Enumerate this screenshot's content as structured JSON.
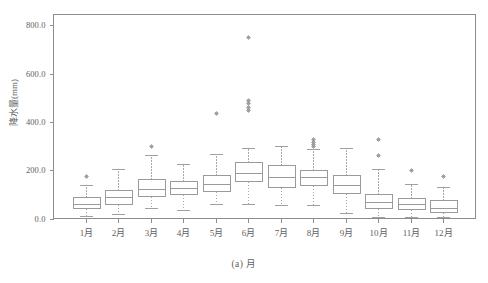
{
  "chart_data": {
    "type": "box",
    "title": "",
    "caption": "(a) 月",
    "xlabel": "",
    "ylabel": "降水量(mm)",
    "grid": false,
    "legend": "none",
    "xlim": [
      0,
      13
    ],
    "ylim": [
      -20,
      850
    ],
    "yticks": [
      0.0,
      200.0,
      400.0,
      600.0,
      800.0
    ],
    "ytick_labels": [
      "0.0",
      "200.0",
      "400.0",
      "600.0",
      "800.0"
    ],
    "categories": [
      "1月",
      "2月",
      "3月",
      "4月",
      "5月",
      "6月",
      "7月",
      "8月",
      "9月",
      "10月",
      "11月",
      "12月"
    ],
    "boxes": [
      {
        "category": "1月",
        "whisker_low": 10,
        "q1": 45,
        "median": 62,
        "q3": 88,
        "whisker_high": 140,
        "outliers": [
          178
        ]
      },
      {
        "category": "2月",
        "whisker_low": 20,
        "q1": 62,
        "median": 88,
        "q3": 118,
        "whisker_high": 205,
        "outliers": []
      },
      {
        "category": "3月",
        "whisker_low": 45,
        "q1": 95,
        "median": 122,
        "q3": 165,
        "whisker_high": 262,
        "outliers": [
          300
        ]
      },
      {
        "category": "4月",
        "whisker_low": 36,
        "q1": 100,
        "median": 125,
        "q3": 155,
        "whisker_high": 225,
        "outliers": []
      },
      {
        "category": "5月",
        "whisker_low": 60,
        "q1": 115,
        "median": 142,
        "q3": 182,
        "whisker_high": 268,
        "outliers": [
          435
        ]
      },
      {
        "category": "6月",
        "whisker_low": 62,
        "q1": 155,
        "median": 188,
        "q3": 235,
        "whisker_high": 290,
        "outliers": [
          450,
          462,
          478,
          490,
          750
        ]
      },
      {
        "category": "7月",
        "whisker_low": 55,
        "q1": 132,
        "median": 172,
        "q3": 222,
        "whisker_high": 300,
        "outliers": []
      },
      {
        "category": "8月",
        "whisker_low": 55,
        "q1": 140,
        "median": 172,
        "q3": 202,
        "whisker_high": 288,
        "outliers": [
          300,
          308,
          318,
          330
        ]
      },
      {
        "category": "9月",
        "whisker_low": 22,
        "q1": 105,
        "median": 138,
        "q3": 180,
        "whisker_high": 290,
        "outliers": []
      },
      {
        "category": "10月",
        "whisker_low": 8,
        "q1": 42,
        "median": 68,
        "q3": 102,
        "whisker_high": 205,
        "outliers": [
          265,
          330
        ]
      },
      {
        "category": "11月",
        "whisker_low": 8,
        "q1": 38,
        "median": 58,
        "q3": 85,
        "whisker_high": 142,
        "outliers": [
          200
        ]
      },
      {
        "category": "12月",
        "whisker_low": 5,
        "q1": 25,
        "median": 42,
        "q3": 75,
        "whisker_high": 132,
        "outliers": [
          178
        ]
      }
    ]
  },
  "colors": {
    "axis": "#8d8d8d",
    "box_stroke": "#9a9a9a",
    "box_fill": "#ffffff",
    "whisker": "#a8a8a8",
    "text": "#5e5e5e",
    "background": "#ffffff"
  }
}
